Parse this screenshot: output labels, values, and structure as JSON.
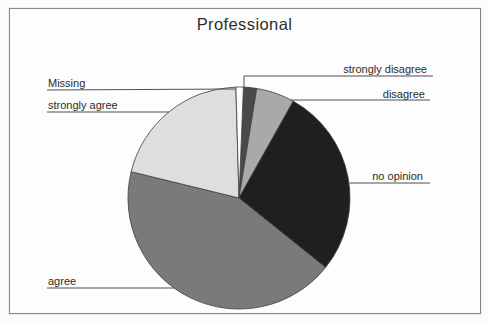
{
  "title": "Professional",
  "chart_data": {
    "type": "pie",
    "title": "Professional",
    "direction": "clockwise",
    "start_angle_deg": 2.3,
    "legend": "none",
    "label_style": "outside labels with leader lines",
    "palette": "grayscale",
    "slices": [
      {
        "label": "strongly disagree",
        "percent": 1.9,
        "angle_deg": 6.9,
        "color": "#4a4a4a"
      },
      {
        "label": "disagree",
        "percent": 5.6,
        "angle_deg": 20.1,
        "color": "#a9a9a9"
      },
      {
        "label": "no opinion",
        "percent": 27.6,
        "angle_deg": 99.4,
        "color": "#1f1f1f"
      },
      {
        "label": "agree",
        "percent": 43.1,
        "angle_deg": 155.0,
        "color": "#7a7a7a"
      },
      {
        "label": "strongly agree",
        "percent": 20.7,
        "angle_deg": 74.7,
        "color": "#dedede"
      },
      {
        "label": "Missing",
        "percent": 1.1,
        "angle_deg": 3.9,
        "color": "#fdfdfd"
      }
    ]
  },
  "colors": {
    "frame_border": "#878787",
    "leader_line": "#4f4f4f",
    "slice_outline": "#3c3c3c",
    "text": "#2b2b2b",
    "background": "#fdfdfd"
  }
}
